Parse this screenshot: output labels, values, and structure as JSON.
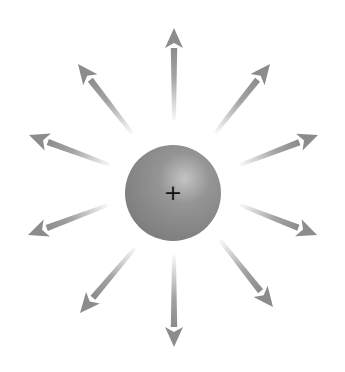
{
  "diagram": {
    "title": "",
    "charge": {
      "sign_label": "+",
      "center": [
        173,
        193
      ],
      "radius": 48,
      "fill_color": "#8a8a8a",
      "highlight_color": "#c4c4c4"
    },
    "field_lines": {
      "count": 10,
      "color": "#8c8c8c",
      "direction": "outward",
      "arrows": [
        {
          "name": "up",
          "start": [
            174,
            120
          ],
          "tip": [
            174,
            28
          ]
        },
        {
          "name": "upper-right",
          "start": [
            215,
            133
          ],
          "tip": [
            270,
            64
          ]
        },
        {
          "name": "right-up",
          "start": [
            240,
            165
          ],
          "tip": [
            318,
            135
          ]
        },
        {
          "name": "right-down",
          "start": [
            240,
            205
          ],
          "tip": [
            317,
            235
          ]
        },
        {
          "name": "lower-right",
          "start": [
            220,
            240
          ],
          "tip": [
            273,
            307
          ]
        },
        {
          "name": "down",
          "start": [
            174,
            255
          ],
          "tip": [
            174,
            347
          ]
        },
        {
          "name": "lower-left",
          "start": [
            135,
            248
          ],
          "tip": [
            80,
            313
          ]
        },
        {
          "name": "left-down",
          "start": [
            108,
            205
          ],
          "tip": [
            28,
            235
          ]
        },
        {
          "name": "left-up",
          "start": [
            110,
            165
          ],
          "tip": [
            29,
            135
          ]
        },
        {
          "name": "upper-left",
          "start": [
            132,
            133
          ],
          "tip": [
            78,
            64
          ]
        }
      ]
    }
  }
}
